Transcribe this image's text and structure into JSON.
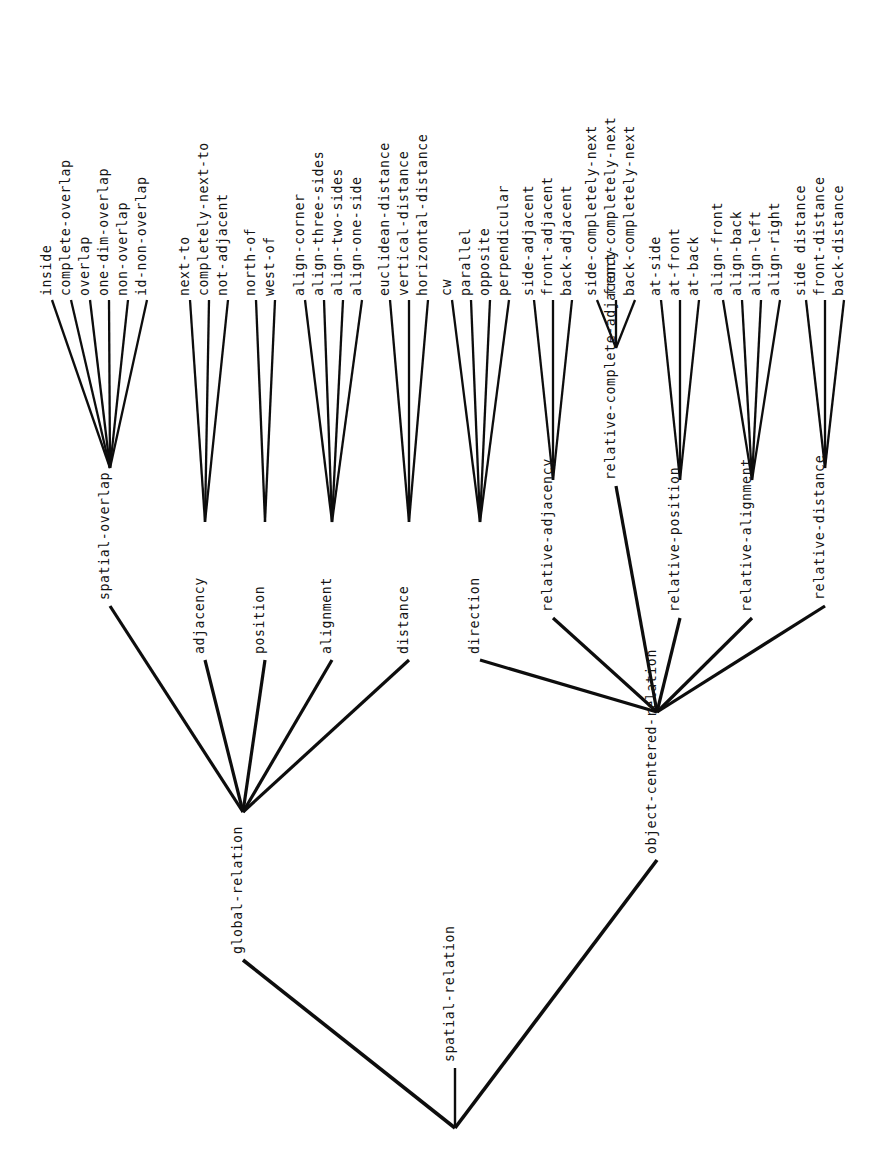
{
  "diagram": {
    "type": "taxonomy-tree",
    "orientation": "bottom-up-vertical-labels",
    "root": {
      "id": "spatial-relation",
      "label": "spatial-relation"
    },
    "level1": [
      {
        "id": "global-relation",
        "label": "global-relation"
      },
      {
        "id": "object-centered-relation",
        "label": "object-centered-relation"
      }
    ],
    "level2": [
      {
        "id": "spatial-overlap",
        "label": "spatial-overlap",
        "parent": "global-relation"
      },
      {
        "id": "adjacency",
        "label": "adjacency",
        "parent": "global-relation"
      },
      {
        "id": "position",
        "label": "position",
        "parent": "global-relation"
      },
      {
        "id": "alignment",
        "label": "alignment",
        "parent": "global-relation"
      },
      {
        "id": "distance",
        "label": "distance",
        "parent": "global-relation"
      },
      {
        "id": "direction",
        "label": "direction",
        "parent": "object-centered-relation"
      },
      {
        "id": "relative-adjacency",
        "label": "relative-adjacency",
        "parent": "object-centered-relation"
      },
      {
        "id": "relative-complete-adjacency",
        "label": "relative-complete-adjacency",
        "parent": "object-centered-relation"
      },
      {
        "id": "relative-position",
        "label": "relative-position",
        "parent": "object-centered-relation"
      },
      {
        "id": "relative-alignment",
        "label": "relative-alignment",
        "parent": "object-centered-relation"
      },
      {
        "id": "relative-distance",
        "label": "relative-distance",
        "parent": "object-centered-relation"
      }
    ],
    "leaves": [
      {
        "label": "inside",
        "parent": "spatial-overlap"
      },
      {
        "label": "complete-overlap",
        "parent": "spatial-overlap"
      },
      {
        "label": "overlap",
        "parent": "spatial-overlap"
      },
      {
        "label": "one-dim-overlap",
        "parent": "spatial-overlap"
      },
      {
        "label": "non-overlap",
        "parent": "spatial-overlap"
      },
      {
        "label": "id-non-overlap",
        "parent": "spatial-overlap"
      },
      {
        "label": "next-to",
        "parent": "adjacency"
      },
      {
        "label": "completely-next-to",
        "parent": "adjacency"
      },
      {
        "label": "not-adjacent",
        "parent": "adjacency"
      },
      {
        "label": "north-of",
        "parent": "position"
      },
      {
        "label": "west-of",
        "parent": "position"
      },
      {
        "label": "align-corner",
        "parent": "alignment"
      },
      {
        "label": "align-three-sides",
        "parent": "alignment"
      },
      {
        "label": "align-two-sides",
        "parent": "alignment"
      },
      {
        "label": "align-one-side",
        "parent": "alignment"
      },
      {
        "label": "euclidean-distance",
        "parent": "distance"
      },
      {
        "label": "vertical-distance",
        "parent": "distance"
      },
      {
        "label": "horizontal-distance",
        "parent": "distance"
      },
      {
        "label": "cw",
        "parent": "direction"
      },
      {
        "label": "parallel",
        "parent": "direction"
      },
      {
        "label": "opposite",
        "parent": "direction"
      },
      {
        "label": "perpendicular",
        "parent": "direction"
      },
      {
        "label": "side-adjacent",
        "parent": "relative-adjacency"
      },
      {
        "label": "front-adjacent",
        "parent": "relative-adjacency"
      },
      {
        "label": "back-adjacent",
        "parent": "relative-adjacency"
      },
      {
        "label": "side-completely-next",
        "parent": "relative-complete-adjacency"
      },
      {
        "label": "front-completely-next",
        "parent": "relative-complete-adjacency"
      },
      {
        "label": "back-completely-next",
        "parent": "relative-complete-adjacency"
      },
      {
        "label": "at-side",
        "parent": "relative-position"
      },
      {
        "label": "at-front",
        "parent": "relative-position"
      },
      {
        "label": "at-back",
        "parent": "relative-position"
      },
      {
        "label": "align-front",
        "parent": "relative-alignment"
      },
      {
        "label": "align-back",
        "parent": "relative-alignment"
      },
      {
        "label": "align-left",
        "parent": "relative-alignment"
      },
      {
        "label": "align-right",
        "parent": "relative-alignment"
      },
      {
        "label": "side distance",
        "parent": "relative-distance"
      },
      {
        "label": "front-distance",
        "parent": "relative-distance"
      },
      {
        "label": "back-distance",
        "parent": "relative-distance"
      }
    ],
    "colors": {
      "background": "#ffffff",
      "edge": "#0d0d0d",
      "text": "#141414"
    }
  },
  "geometry": {
    "leaf_x": [
      52,
      71,
      90,
      109,
      128,
      147,
      190,
      209,
      228,
      256,
      275,
      305,
      324,
      343,
      362,
      390,
      409,
      428,
      452,
      471,
      490,
      509,
      534,
      553,
      572,
      597,
      616,
      635,
      661,
      680,
      699,
      723,
      742,
      761,
      780,
      806,
      825,
      844
    ],
    "leaf_line_top": 300,
    "leaf_text_baseline": 296,
    "mid_nodes": [
      {
        "id": "spatial-overlap",
        "x": 110,
        "y": 468
      },
      {
        "id": "adjacency",
        "x": 205,
        "y": 522
      },
      {
        "id": "position",
        "x": 265,
        "y": 522
      },
      {
        "id": "alignment",
        "x": 332,
        "y": 522
      },
      {
        "id": "distance",
        "x": 409,
        "y": 522
      },
      {
        "id": "direction",
        "x": 480,
        "y": 522
      },
      {
        "id": "relative-adjacency",
        "x": 553,
        "y": 480
      },
      {
        "id": "relative-complete-adjacency",
        "x": 616,
        "y": 348
      },
      {
        "id": "relative-position",
        "x": 680,
        "y": 480
      },
      {
        "id": "relative-alignment",
        "x": 752,
        "y": 480
      },
      {
        "id": "relative-distance",
        "x": 825,
        "y": 468
      }
    ],
    "level1_nodes": [
      {
        "id": "global-relation",
        "x": 243,
        "y": 812
      },
      {
        "id": "object-centered-relation",
        "x": 657,
        "y": 712
      }
    ],
    "root_node": {
      "id": "spatial-relation",
      "x": 455,
      "y": 1128
    }
  }
}
